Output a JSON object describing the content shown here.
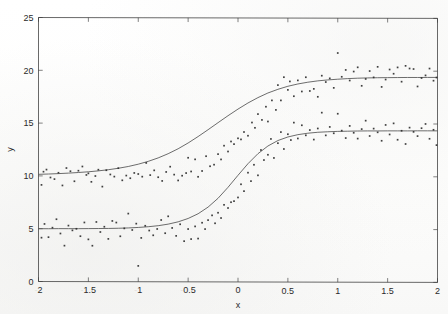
{
  "figure": {
    "background_color": "#fefefe",
    "ink_color": "#3a3a3a",
    "curve_color": "#4a4a4a",
    "point_color": "#2b2b2b"
  },
  "chart_data": {
    "type": "scatter",
    "title": "",
    "subtitle": "",
    "xlabel": "x",
    "ylabel": "y",
    "xlim": [
      -2,
      2
    ],
    "ylim": [
      0,
      25
    ],
    "xticks": [
      -2,
      -1.5,
      -1,
      -0.5,
      0,
      0.5,
      1,
      1.5,
      2
    ],
    "xticklabels": [
      "-2",
      "-1.5",
      "-1",
      "-0.5",
      "0",
      "0.5",
      "1",
      "1.5",
      "2"
    ],
    "yticks": [
      0,
      5,
      10,
      15,
      20,
      25
    ],
    "yticklabels": [
      "0",
      "5",
      "10",
      "15",
      "20",
      "25"
    ],
    "grid": false,
    "legend": "none",
    "legend_position": "none",
    "series": [
      {
        "name": "upper-logistic-fit",
        "kind": "line",
        "model": "logistic",
        "lower_asymptote": 10.0,
        "upper_asymptote": 19.2,
        "midpoint_x": 0.0,
        "rate": 2.05,
        "x": [
          -2,
          -1.9,
          -1.8,
          -1.7,
          -1.6,
          -1.5,
          -1.4,
          -1.3,
          -1.2,
          -1.1,
          -1,
          -0.9,
          -0.8,
          -0.7,
          -0.6,
          -0.5,
          -0.4,
          -0.3,
          -0.2,
          -0.1,
          0,
          0.1,
          0.2,
          0.3,
          0.4,
          0.5,
          0.6,
          0.7,
          0.8,
          0.9,
          1,
          1.1,
          1.2,
          1.3,
          1.4,
          1.5,
          1.6,
          1.7,
          1.8,
          1.9,
          2
        ],
        "y": [
          10.15,
          10.18,
          10.22,
          10.27,
          10.33,
          10.4,
          10.49,
          10.6,
          10.74,
          10.91,
          11.13,
          11.4,
          11.73,
          12.13,
          12.6,
          13.15,
          13.76,
          14.41,
          15.08,
          15.74,
          16.37,
          16.95,
          17.46,
          17.9,
          18.25,
          18.54,
          18.76,
          18.93,
          19.06,
          19.15,
          19.22,
          19.28,
          19.32,
          19.35,
          19.37,
          19.38,
          19.39,
          19.4,
          19.4,
          19.41,
          19.41
        ]
      },
      {
        "name": "lower-logistic-fit",
        "kind": "line",
        "model": "logistic",
        "lower_asymptote": 5.0,
        "upper_asymptote": 14.35,
        "midpoint_x": 0.1,
        "rate": 4.1,
        "x": [
          -2,
          -1.9,
          -1.8,
          -1.7,
          -1.6,
          -1.5,
          -1.4,
          -1.3,
          -1.2,
          -1.1,
          -1,
          -0.9,
          -0.8,
          -0.7,
          -0.6,
          -0.5,
          -0.4,
          -0.3,
          -0.2,
          -0.1,
          0,
          0.1,
          0.2,
          0.3,
          0.4,
          0.5,
          0.6,
          0.7,
          0.8,
          0.9,
          1,
          1.1,
          1.2,
          1.3,
          1.4,
          1.5,
          1.6,
          1.7,
          1.8,
          1.9,
          2
        ],
        "y": [
          5.0,
          5.0,
          5.01,
          5.01,
          5.01,
          5.02,
          5.03,
          5.04,
          5.06,
          5.09,
          5.14,
          5.21,
          5.31,
          5.46,
          5.68,
          6.0,
          6.45,
          7.08,
          7.92,
          8.96,
          10.1,
          11.2,
          12.15,
          12.88,
          13.4,
          13.74,
          13.96,
          14.1,
          14.19,
          14.24,
          14.28,
          14.3,
          14.32,
          14.33,
          14.33,
          14.34,
          14.34,
          14.34,
          14.35,
          14.35,
          14.35
        ]
      },
      {
        "name": "upper-observations",
        "kind": "points",
        "points": [
          [
            -1.97,
            9.15
          ],
          [
            -1.95,
            10.4
          ],
          [
            -1.92,
            10.6
          ],
          [
            -1.88,
            9.85
          ],
          [
            -1.84,
            9.7
          ],
          [
            -1.8,
            10.3
          ],
          [
            -1.76,
            9.1
          ],
          [
            -1.72,
            10.75
          ],
          [
            -1.68,
            10.45
          ],
          [
            -1.64,
            9.5
          ],
          [
            -1.6,
            10.5
          ],
          [
            -1.56,
            10.9
          ],
          [
            -1.52,
            10.1
          ],
          [
            -1.5,
            10.25
          ],
          [
            -1.47,
            9.45
          ],
          [
            -1.43,
            10.0
          ],
          [
            -1.4,
            10.6
          ],
          [
            -1.36,
            9.0
          ],
          [
            -1.32,
            10.55
          ],
          [
            -1.28,
            10.15
          ],
          [
            -1.24,
            9.95
          ],
          [
            -1.2,
            10.75
          ],
          [
            -1.16,
            9.6
          ],
          [
            -1.12,
            10.05
          ],
          [
            -1.08,
            9.8
          ],
          [
            -1.04,
            10.3
          ],
          [
            -1,
            10.2
          ],
          [
            -0.96,
            9.95
          ],
          [
            -0.92,
            11.25
          ],
          [
            -0.88,
            10.1
          ],
          [
            -0.84,
            10.55
          ],
          [
            -0.8,
            9.9
          ],
          [
            -0.76,
            9.55
          ],
          [
            -0.72,
            10.4
          ],
          [
            -0.68,
            10.9
          ],
          [
            -0.64,
            10.15
          ],
          [
            -0.6,
            9.6
          ],
          [
            -0.56,
            10.05
          ],
          [
            -0.52,
            10.3
          ],
          [
            -0.5,
            11.75
          ],
          [
            -0.47,
            10.45
          ],
          [
            -0.43,
            11.6
          ],
          [
            -0.4,
            9.95
          ],
          [
            -0.36,
            10.5
          ],
          [
            -0.32,
            11.9
          ],
          [
            -0.28,
            10.95
          ],
          [
            -0.24,
            11.1
          ],
          [
            -0.2,
            12.1
          ],
          [
            -0.17,
            11.6
          ],
          [
            -0.14,
            12.9
          ],
          [
            -0.1,
            12.35
          ],
          [
            -0.07,
            13.3
          ],
          [
            -0.04,
            13.05
          ],
          [
            0,
            13.6
          ],
          [
            0.03,
            13.5
          ],
          [
            0.06,
            14.2
          ],
          [
            0.1,
            13.85
          ],
          [
            0.14,
            15.1
          ],
          [
            0.17,
            14.6
          ],
          [
            0.2,
            15.9
          ],
          [
            0.24,
            15.35
          ],
          [
            0.28,
            16.6
          ],
          [
            0.3,
            15.2
          ],
          [
            0.34,
            17.2
          ],
          [
            0.38,
            16.3
          ],
          [
            0.4,
            18.65
          ],
          [
            0.43,
            17.2
          ],
          [
            0.46,
            19.4
          ],
          [
            0.5,
            18.2
          ],
          [
            0.52,
            19.0
          ],
          [
            0.56,
            17.6
          ],
          [
            0.6,
            19.1
          ],
          [
            0.64,
            18.05
          ],
          [
            0.68,
            19.4
          ],
          [
            0.72,
            18.1
          ],
          [
            0.76,
            18.3
          ],
          [
            0.8,
            17.55
          ],
          [
            0.84,
            19.55
          ],
          [
            0.88,
            18.95
          ],
          [
            0.92,
            19.3
          ],
          [
            0.96,
            18.4
          ],
          [
            1,
            21.7
          ],
          [
            1.04,
            19.45
          ],
          [
            1.08,
            20.1
          ],
          [
            1.12,
            19.1
          ],
          [
            1.16,
            19.95
          ],
          [
            1.2,
            20.35
          ],
          [
            1.24,
            18.6
          ],
          [
            1.28,
            19.25
          ],
          [
            1.32,
            20.0
          ],
          [
            1.36,
            19.4
          ],
          [
            1.4,
            20.4
          ],
          [
            1.44,
            18.5
          ],
          [
            1.48,
            19.2
          ],
          [
            1.52,
            20.15
          ],
          [
            1.56,
            19.75
          ],
          [
            1.6,
            20.35
          ],
          [
            1.64,
            19.0
          ],
          [
            1.68,
            20.5
          ],
          [
            1.72,
            20.25
          ],
          [
            1.76,
            20.2
          ],
          [
            1.8,
            18.55
          ],
          [
            1.84,
            19.35
          ],
          [
            1.88,
            19.6
          ],
          [
            1.92,
            20.25
          ],
          [
            1.96,
            19.1
          ],
          [
            1.99,
            19.4
          ]
        ]
      },
      {
        "name": "lower-observations",
        "kind": "points",
        "points": [
          [
            -1.97,
            4.15
          ],
          [
            -1.94,
            5.45
          ],
          [
            -1.9,
            4.2
          ],
          [
            -1.86,
            5.1
          ],
          [
            -1.82,
            5.9
          ],
          [
            -1.78,
            4.55
          ],
          [
            -1.74,
            3.4
          ],
          [
            -1.7,
            5.3
          ],
          [
            -1.66,
            4.85
          ],
          [
            -1.62,
            5.0
          ],
          [
            -1.58,
            4.3
          ],
          [
            -1.54,
            5.6
          ],
          [
            -1.5,
            4.0
          ],
          [
            -1.46,
            3.4
          ],
          [
            -1.42,
            5.65
          ],
          [
            -1.38,
            4.7
          ],
          [
            -1.34,
            5.2
          ],
          [
            -1.3,
            4.05
          ],
          [
            -1.26,
            5.75
          ],
          [
            -1.22,
            5.6
          ],
          [
            -1.18,
            4.3
          ],
          [
            -1.14,
            5.05
          ],
          [
            -1.1,
            6.45
          ],
          [
            -1.06,
            4.9
          ],
          [
            -1.02,
            5.5
          ],
          [
            -1,
            1.5
          ],
          [
            -0.97,
            4.15
          ],
          [
            -0.93,
            5.3
          ],
          [
            -0.89,
            4.85
          ],
          [
            -0.85,
            4.4
          ],
          [
            -0.81,
            5.0
          ],
          [
            -0.77,
            5.85
          ],
          [
            -0.73,
            4.6
          ],
          [
            -0.7,
            6.2
          ],
          [
            -0.66,
            5.1
          ],
          [
            -0.62,
            4.35
          ],
          [
            -0.58,
            5.45
          ],
          [
            -0.54,
            3.85
          ],
          [
            -0.5,
            5.0
          ],
          [
            -0.47,
            4.05
          ],
          [
            -0.43,
            5.25
          ],
          [
            -0.4,
            4.1
          ],
          [
            -0.36,
            5.6
          ],
          [
            -0.33,
            5.0
          ],
          [
            -0.3,
            5.85
          ],
          [
            -0.26,
            6.3
          ],
          [
            -0.23,
            5.55
          ],
          [
            -0.2,
            6.55
          ],
          [
            -0.17,
            6.05
          ],
          [
            -0.14,
            7.3
          ],
          [
            -0.1,
            7.0
          ],
          [
            -0.07,
            7.55
          ],
          [
            -0.04,
            7.65
          ],
          [
            0,
            8.0
          ],
          [
            0.03,
            9.25
          ],
          [
            0.06,
            8.6
          ],
          [
            0.1,
            10.35
          ],
          [
            0.13,
            9.55
          ],
          [
            0.16,
            11.1
          ],
          [
            0.2,
            10.1
          ],
          [
            0.23,
            12.5
          ],
          [
            0.26,
            11.55
          ],
          [
            0.3,
            12.05
          ],
          [
            0.33,
            13.55
          ],
          [
            0.36,
            11.75
          ],
          [
            0.4,
            13.15
          ],
          [
            0.43,
            14.2
          ],
          [
            0.46,
            12.6
          ],
          [
            0.5,
            14.0
          ],
          [
            0.53,
            13.45
          ],
          [
            0.56,
            15.1
          ],
          [
            0.6,
            13.6
          ],
          [
            0.64,
            14.85
          ],
          [
            0.68,
            13.9
          ],
          [
            0.72,
            14.4
          ],
          [
            0.76,
            13.5
          ],
          [
            0.8,
            14.55
          ],
          [
            0.84,
            16.05
          ],
          [
            0.88,
            13.9
          ],
          [
            0.92,
            14.7
          ],
          [
            0.96,
            14.1
          ],
          [
            1,
            15.95
          ],
          [
            1.04,
            14.35
          ],
          [
            1.08,
            13.65
          ],
          [
            1.12,
            14.8
          ],
          [
            1.16,
            14.15
          ],
          [
            1.2,
            13.6
          ],
          [
            1.24,
            14.5
          ],
          [
            1.28,
            15.3
          ],
          [
            1.32,
            13.85
          ],
          [
            1.36,
            14.55
          ],
          [
            1.4,
            14.2
          ],
          [
            1.44,
            13.4
          ],
          [
            1.48,
            14.9
          ],
          [
            1.52,
            14.0
          ],
          [
            1.56,
            15.05
          ],
          [
            1.6,
            13.5
          ],
          [
            1.64,
            14.35
          ],
          [
            1.68,
            13.1
          ],
          [
            1.72,
            14.65
          ],
          [
            1.76,
            14.25
          ],
          [
            1.8,
            13.85
          ],
          [
            1.84,
            14.6
          ],
          [
            1.88,
            15.0
          ],
          [
            1.92,
            13.6
          ],
          [
            1.96,
            14.45
          ],
          [
            1.99,
            13.0
          ]
        ]
      }
    ]
  }
}
